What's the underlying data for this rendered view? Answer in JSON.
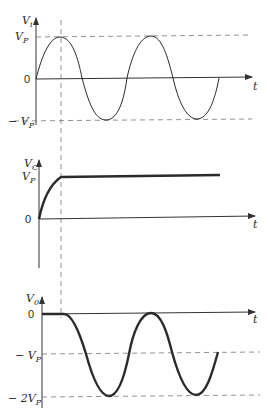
{
  "diagram": {
    "time_label": "t",
    "plots": [
      {
        "id": "input",
        "y_label": "V",
        "y_sub": "i",
        "ticks": [
          {
            "label_main": "V",
            "label_sub": "P",
            "prefix": ""
          },
          {
            "label_main": "0",
            "label_sub": "",
            "prefix": ""
          },
          {
            "label_main": "V",
            "label_sub": "P",
            "prefix": "− "
          }
        ]
      },
      {
        "id": "capacitor",
        "y_label": "V",
        "y_sub": "C",
        "ticks": [
          {
            "label_main": "V",
            "label_sub": "P",
            "prefix": ""
          },
          {
            "label_main": "0",
            "label_sub": "",
            "prefix": ""
          }
        ]
      },
      {
        "id": "output",
        "y_label": "V",
        "y_sub": "0",
        "ticks": [
          {
            "label_main": "0",
            "label_sub": "",
            "prefix": ""
          },
          {
            "label_main": "V",
            "label_sub": "P",
            "prefix": "− "
          },
          {
            "label_main": "V",
            "label_sub": "P",
            "prefix": "− 2"
          }
        ]
      }
    ]
  }
}
